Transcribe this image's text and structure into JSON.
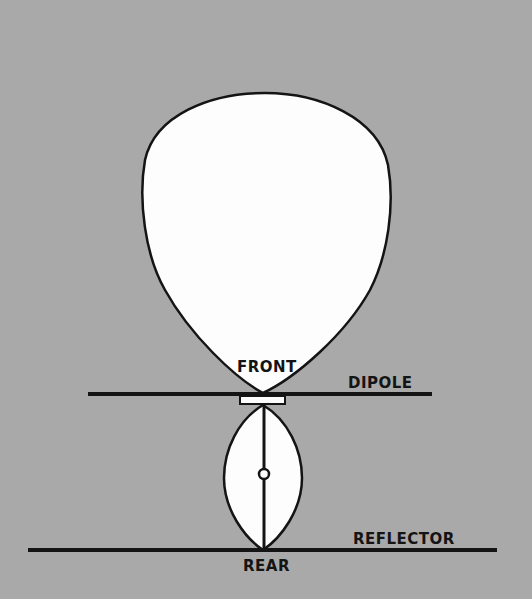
{
  "diagram": {
    "labels": {
      "front": "FRONT",
      "dipole": "DIPOLE",
      "rear": "REAR",
      "reflector": "REFLECTOR"
    },
    "colors": {
      "background": "#a9a9a9",
      "lobe_fill": "#fdfdfd",
      "stroke": "#141414"
    }
  }
}
